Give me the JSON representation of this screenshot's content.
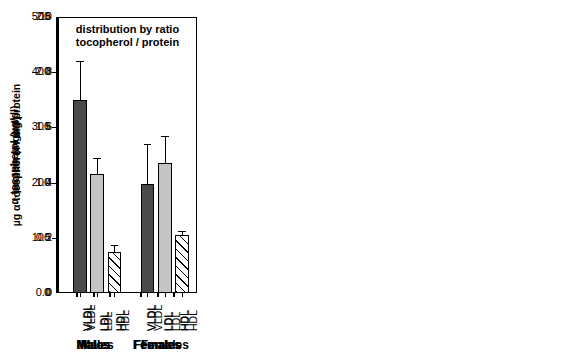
{
  "figure": {
    "panel_count": 3,
    "group_labels": [
      "Males",
      "Females"
    ],
    "fraction_labels": [
      "VLDL",
      "LDL",
      "HDL"
    ],
    "colors": {
      "vldl": "#4a4a4a",
      "ldl": "#c4c4c4",
      "hdl": "#ffffff",
      "axis": "#000000",
      "background": "#ffffff"
    }
  },
  "chart_data": [
    {
      "type": "bar",
      "title": "α-tocopherol distribution",
      "title_lines": [
        "α-tocopherol",
        "distribution"
      ],
      "xlabel": "",
      "ylabel": "α-tocopherol (µg/dl)",
      "ylim": [
        0,
        500
      ],
      "yticks": [
        0,
        100,
        200,
        300,
        400,
        500
      ],
      "ytick_labels": [
        "0",
        "100",
        "200",
        "300",
        "400",
        "500"
      ],
      "grid": false,
      "legend": "none",
      "categories": [
        "VLDL",
        "LDL",
        "HDL",
        "VLDL",
        "LDL",
        "HDL"
      ],
      "groups": [
        "Males",
        "Males",
        "Males",
        "Females",
        "Females",
        "Females"
      ],
      "values": [
        54,
        362,
        218,
        14,
        286,
        400
      ],
      "errors": [
        10,
        40,
        32,
        4,
        36,
        74
      ],
      "series": [
        {
          "name": "Males",
          "categories": [
            "VLDL",
            "LDL",
            "HDL"
          ],
          "values": [
            54,
            362,
            218
          ],
          "errors": [
            10,
            40,
            32
          ]
        },
        {
          "name": "Females",
          "categories": [
            "VLDL",
            "LDL",
            "HDL"
          ],
          "values": [
            14,
            286,
            400
          ],
          "errors": [
            4,
            36,
            74
          ]
        }
      ]
    },
    {
      "type": "bar",
      "title": "protein distribution",
      "title_lines": [
        "protein",
        "distribution"
      ],
      "xlabel": "",
      "ylabel": "protein (mg/ml)",
      "ylim": [
        0.0,
        2.5
      ],
      "yticks": [
        0.0,
        0.5,
        1.0,
        1.5,
        2.0,
        2.5
      ],
      "ytick_labels": [
        "0.0",
        "0.5",
        "1.0",
        "1.5",
        "2.0",
        "2.5"
      ],
      "grid": false,
      "legend": "none",
      "categories": [
        "VLDL",
        "LDL",
        "HDL",
        "VLDL",
        "LDL",
        "HDL"
      ],
      "groups": [
        "Males",
        "Males",
        "Males",
        "Females",
        "Females",
        "Females"
      ],
      "values": [
        0.09,
        0.89,
        1.41,
        0.04,
        0.62,
        1.87
      ],
      "errors": [
        0.03,
        0.13,
        0.15,
        0.015,
        0.05,
        0.14
      ],
      "series": [
        {
          "name": "Males",
          "categories": [
            "VLDL",
            "LDL",
            "HDL"
          ],
          "values": [
            0.09,
            0.89,
            1.41
          ],
          "errors": [
            0.03,
            0.13,
            0.15
          ]
        },
        {
          "name": "Females",
          "categories": [
            "VLDL",
            "LDL",
            "HDL"
          ],
          "values": [
            0.04,
            0.62,
            1.87
          ],
          "errors": [
            0.015,
            0.05,
            0.14
          ]
        }
      ]
    },
    {
      "type": "bar",
      "title": "distribution by ratio tocopherol / protein",
      "title_lines": [
        "distribution by ratio",
        "tocopherol / protein"
      ],
      "xlabel": "",
      "ylabel": "µg α-tocopherol / mg protein",
      "ylim": [
        0,
        10
      ],
      "yticks": [
        0,
        2,
        4,
        6,
        8,
        10
      ],
      "ytick_labels": [
        "0",
        "2",
        "4",
        "6",
        "8",
        "10"
      ],
      "grid": false,
      "legend": "none",
      "categories": [
        "VLDL",
        "LDL",
        "HDL",
        "VLDL",
        "LDL",
        "HDL"
      ],
      "groups": [
        "Males",
        "Males",
        "Males",
        "Females",
        "Females",
        "Females"
      ],
      "values": [
        7.0,
        4.3,
        1.5,
        3.95,
        4.7,
        2.1
      ],
      "errors": [
        1.4,
        0.6,
        0.25,
        1.45,
        1.0,
        0.15
      ],
      "series": [
        {
          "name": "Males",
          "categories": [
            "VLDL",
            "LDL",
            "HDL"
          ],
          "values": [
            7.0,
            4.3,
            1.5
          ],
          "errors": [
            1.4,
            0.6,
            0.25
          ]
        },
        {
          "name": "Females",
          "categories": [
            "VLDL",
            "LDL",
            "HDL"
          ],
          "values": [
            3.95,
            4.7,
            2.1
          ],
          "errors": [
            1.45,
            1.0,
            0.15
          ]
        }
      ]
    }
  ]
}
